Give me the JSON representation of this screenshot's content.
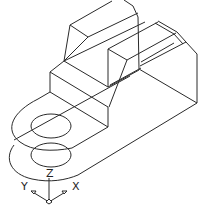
{
  "drawing": {
    "type": "isometric-wireframe",
    "stroke_color": "#2a2a2a",
    "background": "#ffffff"
  },
  "ucs_icon": {
    "z_label": "Z",
    "y_label": "Y",
    "x_label": "X"
  }
}
